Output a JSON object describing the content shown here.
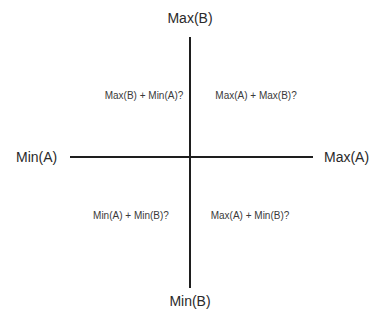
{
  "diagram": {
    "type": "quadrant",
    "axes": {
      "x": {
        "min_label": "Min(A)",
        "max_label": "Max(A)"
      },
      "y": {
        "min_label": "Min(B)",
        "max_label": "Max(B)"
      }
    },
    "quadrants": {
      "top_left": "Max(B) + Min(A)?",
      "top_right": "Max(A) + Max(B)?",
      "bottom_left": "Min(A) + Min(B)?",
      "bottom_right": "Max(A) + Min(B)?"
    },
    "colors": {
      "axis_line": "#1e1e1e",
      "text": "#2a2a2a",
      "background": "#ffffff"
    }
  }
}
